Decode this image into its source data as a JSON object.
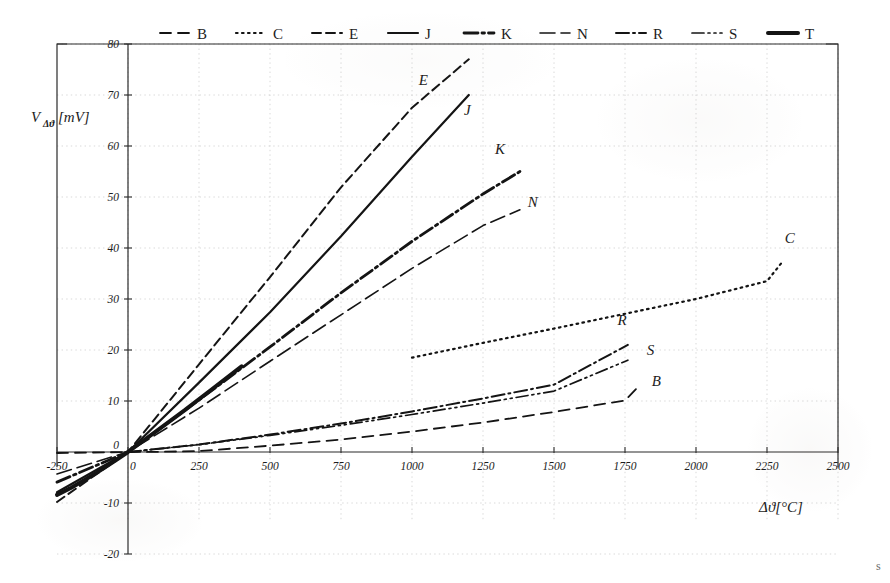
{
  "figure": {
    "title": "",
    "corner_mark": "s"
  },
  "axes": {
    "x_title": "Δϑ[°C]",
    "y_title": "VΔϑ[mV]",
    "y_title_main": "V",
    "y_title_sub": "Δϑ",
    "y_title_unit": "[mV]",
    "x_ticks": [
      "-250",
      "0",
      "250",
      "500",
      "750",
      "1000",
      "1250",
      "1500",
      "1750",
      "2000",
      "2250",
      "2500"
    ],
    "y_ticks": [
      "-20",
      "-10",
      "0",
      "10",
      "20",
      "30",
      "40",
      "50",
      "60",
      "70",
      "80"
    ]
  },
  "legend": {
    "position": "top",
    "items": [
      {
        "label": "B",
        "style": "dashed"
      },
      {
        "label": "C",
        "style": "dotted"
      },
      {
        "label": "E",
        "style": "dashed-fine"
      },
      {
        "label": "J",
        "style": "solid"
      },
      {
        "label": "K",
        "style": "dash-dot-thick"
      },
      {
        "label": "N",
        "style": "long-dash"
      },
      {
        "label": "R",
        "style": "dash-dot"
      },
      {
        "label": "S",
        "style": "dash-dot-dot"
      },
      {
        "label": "T",
        "style": "solid-thick"
      }
    ]
  },
  "chart_data": {
    "type": "line",
    "title": "",
    "xlabel": "Δϑ[°C]",
    "ylabel": "VΔϑ[mV]",
    "xlim": [
      -250,
      2500
    ],
    "ylim": [
      -20,
      80
    ],
    "xticks": [
      -250,
      0,
      250,
      500,
      750,
      1000,
      1250,
      1500,
      1750,
      2000,
      2250,
      2500
    ],
    "yticks": [
      -20,
      -10,
      0,
      10,
      20,
      30,
      40,
      50,
      60,
      70,
      80
    ],
    "grid": true,
    "legend_position": "top",
    "series": [
      {
        "name": "B",
        "style": "dashed",
        "width": 1.8,
        "label_xy": [
          1860,
          13.0
        ],
        "x": [
          -250,
          0,
          100,
          250,
          500,
          750,
          1000,
          1250,
          1500,
          1750,
          1800
        ],
        "y": [
          -0.2,
          0.0,
          0.03,
          0.18,
          1.24,
          2.43,
          4.01,
          5.78,
          7.85,
          10.1,
          13.0
        ]
      },
      {
        "name": "C",
        "style": "dotted",
        "width": 2.2,
        "label_xy": [
          2330,
          41.0
        ],
        "x": [
          1000,
          1250,
          1500,
          1750,
          2000,
          2250,
          2300
        ],
        "y": [
          18.5,
          21.4,
          24.2,
          27.1,
          30.0,
          33.5,
          37.0
        ]
      },
      {
        "name": "E",
        "style": "dashed-fine",
        "width": 2.0,
        "label_xy": [
          1040,
          72.0
        ],
        "x": [
          -250,
          0,
          250,
          500,
          750,
          1000,
          1200
        ],
        "y": [
          -9.8,
          0.0,
          17.2,
          34.3,
          51.9,
          67.5,
          77.0
        ]
      },
      {
        "name": "J",
        "style": "solid",
        "width": 2.2,
        "label_xy": [
          1195,
          66.0
        ],
        "x": [
          -250,
          0,
          250,
          500,
          750,
          1000,
          1200
        ],
        "y": [
          -7.9,
          0.0,
          13.6,
          27.4,
          42.3,
          57.9,
          70.0
        ]
      },
      {
        "name": "K",
        "style": "dash-dot-thick",
        "width": 2.8,
        "label_xy": [
          1310,
          58.5
        ],
        "x": [
          -250,
          0,
          250,
          500,
          750,
          1000,
          1250,
          1380
        ],
        "y": [
          -5.9,
          0.0,
          10.2,
          20.6,
          31.2,
          41.3,
          50.6,
          55.0
        ]
      },
      {
        "name": "N",
        "style": "long-dash",
        "width": 1.6,
        "label_xy": [
          1425,
          48.0
        ],
        "x": [
          -250,
          0,
          250,
          500,
          750,
          1000,
          1250,
          1380
        ],
        "y": [
          -4.3,
          0.0,
          8.6,
          17.8,
          26.9,
          36.0,
          44.4,
          47.5
        ]
      },
      {
        "name": "R",
        "style": "dash-dot",
        "width": 2.0,
        "label_xy": [
          1740,
          25.0
        ],
        "x": [
          0,
          250,
          500,
          750,
          1000,
          1250,
          1500,
          1760
        ],
        "y": [
          0.0,
          1.47,
          3.41,
          5.58,
          7.95,
          10.5,
          13.2,
          21.0
        ]
      },
      {
        "name": "S",
        "style": "dash-dot-dot",
        "width": 1.7,
        "label_xy": [
          1840,
          19.0
        ],
        "x": [
          0,
          250,
          500,
          750,
          1000,
          1250,
          1500,
          1760
        ],
        "y": [
          0.0,
          1.44,
          3.26,
          5.24,
          7.35,
          9.59,
          11.95,
          18.0
        ]
      },
      {
        "name": "T",
        "style": "solid-thick",
        "width": 4.0,
        "label_xy": [
          null,
          null
        ],
        "x": [
          -250,
          -200,
          -150,
          -100,
          -50,
          0,
          100,
          200,
          300,
          400
        ],
        "y": [
          -8.4,
          -7.0,
          -5.4,
          -3.7,
          -1.9,
          0.0,
          4.1,
          8.2,
          12.5,
          16.8
        ]
      }
    ]
  }
}
